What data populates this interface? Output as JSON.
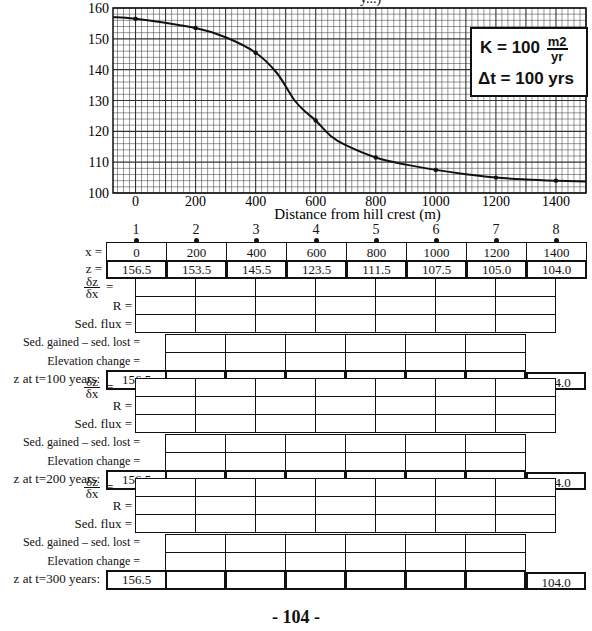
{
  "page": {
    "title_fragment": "y...)",
    "page_number": "- 104 -"
  },
  "chart_data": {
    "type": "line",
    "title": "",
    "xlabel": "Distance from hill crest (m)",
    "ylabel": "",
    "x_ticks": [
      0,
      200,
      400,
      600,
      800,
      1000,
      1200,
      1400
    ],
    "y_ticks": [
      100,
      110,
      120,
      130,
      140,
      150,
      160
    ],
    "xlim": [
      -75,
      1500
    ],
    "ylim": [
      100,
      160
    ],
    "grid": true,
    "legend": null,
    "series": [
      {
        "name": "Hillslope profile (t=0)",
        "x": [
          0,
          200,
          400,
          600,
          800,
          1000,
          1200,
          1400
        ],
        "y": [
          156.5,
          153.5,
          145.5,
          123.5,
          111.5,
          107.5,
          105.0,
          104.0
        ]
      }
    ],
    "annotations": {
      "kappa_label": "K = 100",
      "kappa_unit_num": "m2",
      "kappa_unit_den": "yr",
      "dt_label": "Δt = 100 yrs"
    }
  },
  "table": {
    "node_numbers": [
      "1",
      "2",
      "3",
      "4",
      "5",
      "6",
      "7",
      "8"
    ],
    "x_label": "x =",
    "z_label": "z =",
    "x_values": [
      "0",
      "200",
      "400",
      "600",
      "800",
      "1000",
      "1200",
      "1400"
    ],
    "z_values": [
      "156.5",
      "153.5",
      "145.5",
      "123.5",
      "111.5",
      "107.5",
      "105.0",
      "104.0"
    ],
    "dzdx_num": "δz",
    "dzdx_den": "δx",
    "dzdx_eq": "=",
    "r_label": "R =",
    "flux_label": "Sed. flux =",
    "gained_label": "Sed. gained – sed. lost =",
    "elev_label": "Elevation  change =",
    "steps": [
      {
        "z_label": "z at t=100 years:",
        "first": "156.5",
        "last": "104.0"
      },
      {
        "z_label": "z at t=200 years:",
        "first": "156.5",
        "last": "104.0"
      },
      {
        "z_label": "z at t=300 years:",
        "first": "156.5",
        "last": "104.0"
      }
    ]
  }
}
